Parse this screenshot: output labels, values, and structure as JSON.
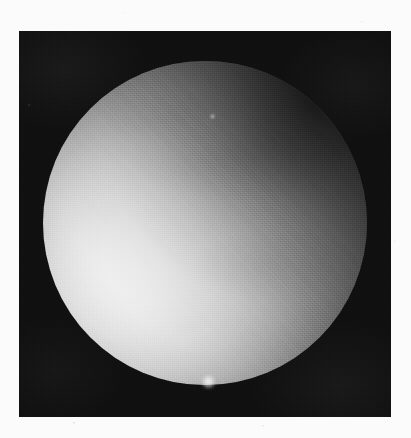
{
  "plate": {
    "kind": "astronomical-photograph",
    "subject": "illuminated planetary sphere",
    "medium": "grayscale halftone print scan",
    "canvas_width": 411,
    "canvas_height": 438,
    "margin_color": "#fbfbfb"
  },
  "panel": {
    "label": "dark sky field",
    "x": 19,
    "y": 31,
    "width": 372,
    "height": 386,
    "background_color": "#101010",
    "noise": "halftone screen"
  },
  "sphere": {
    "label": "planetary disc",
    "center_x": 205,
    "center_y": 223,
    "radius": 162,
    "diameter": 324,
    "bounds": {
      "left": 43,
      "top": 61,
      "right": 367,
      "bottom": 385
    },
    "highlight_color": "#ffffff",
    "midtone_color": "#b9b9b9",
    "shadow_color": "#1f1f1f",
    "terminator_side": "upper-right",
    "illumination_center_x": 153,
    "illumination_center_y": 256
  },
  "halo": {
    "label": "limb haze",
    "center_x": 205,
    "center_y": 223,
    "radius": 176
  },
  "features": [
    {
      "name": "limb-bright-spot",
      "x": 208,
      "y": 381,
      "size": 15,
      "brightness": "high"
    },
    {
      "name": "disc-fleck",
      "x": 212,
      "y": 116,
      "size": 5,
      "brightness": "medium"
    }
  ],
  "chart_data": {
    "type": "heatmap",
    "title": "",
    "x": [
      0,
      0.1,
      0.2,
      0.3,
      0.4,
      0.5,
      0.6,
      0.7,
      0.8,
      0.9,
      1.0
    ],
    "xlabel": "normalized radius from illumination center",
    "ylabel": "relative brightness (0-255)",
    "values": [
      255,
      252,
      243,
      226,
      201,
      172,
      138,
      104,
      72,
      45,
      20
    ],
    "ylim": [
      0,
      255
    ],
    "grid": false,
    "legend": "none"
  }
}
